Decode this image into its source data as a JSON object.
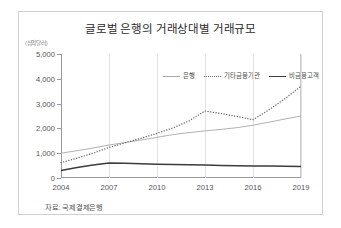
{
  "figure": {
    "title": "글로벌 은행의 거래상대별 거래규모",
    "y_axis_unit": "(십억달러)",
    "source_note": "자료: 국제결제은행"
  },
  "legend": {
    "items": [
      {
        "label": "은행",
        "style": "solid",
        "color": "#a8a8a8"
      },
      {
        "label": "기타금융기관",
        "style": "dotted",
        "color": "#6e6e6e"
      },
      {
        "label": "비금융고객",
        "style": "thick-solid",
        "color": "#3c3c3c"
      }
    ]
  },
  "chart_data": {
    "type": "line",
    "title": "글로벌 은행의 거래상대별 거래규모",
    "xlabel": "",
    "ylabel": "(십억달러)",
    "x": [
      2004,
      2005,
      2006,
      2007,
      2008,
      2009,
      2010,
      2011,
      2012,
      2013,
      2014,
      2015,
      2016,
      2017,
      2018,
      2019
    ],
    "xticks": [
      "2004",
      "2007",
      "2010",
      "2013",
      "2016",
      "2019"
    ],
    "yticks": [
      "0",
      "1,000",
      "2,000",
      "3,000",
      "4,000",
      "5,000"
    ],
    "ylim": [
      0,
      5000
    ],
    "xlim": [
      2004,
      2019
    ],
    "grid": "vertical",
    "legend_position": "top-right",
    "series": [
      {
        "name": "은행",
        "style": "solid",
        "color": "#a8a8a8",
        "values": [
          1000,
          1100,
          1210,
          1330,
          1430,
          1530,
          1640,
          1750,
          1830,
          1900,
          1960,
          2030,
          2130,
          2250,
          2380,
          2500
        ]
      },
      {
        "name": "기타금융기관",
        "style": "dotted",
        "color": "#6e6e6e",
        "values": [
          620,
          800,
          1000,
          1230,
          1420,
          1600,
          1800,
          2020,
          2300,
          2700,
          2600,
          2480,
          2350,
          2750,
          3200,
          3700
        ]
      },
      {
        "name": "비금융고객",
        "style": "thick-solid",
        "color": "#3c3c3c",
        "values": [
          300,
          420,
          520,
          600,
          590,
          570,
          550,
          540,
          530,
          520,
          505,
          495,
          480,
          480,
          470,
          460
        ]
      }
    ]
  }
}
